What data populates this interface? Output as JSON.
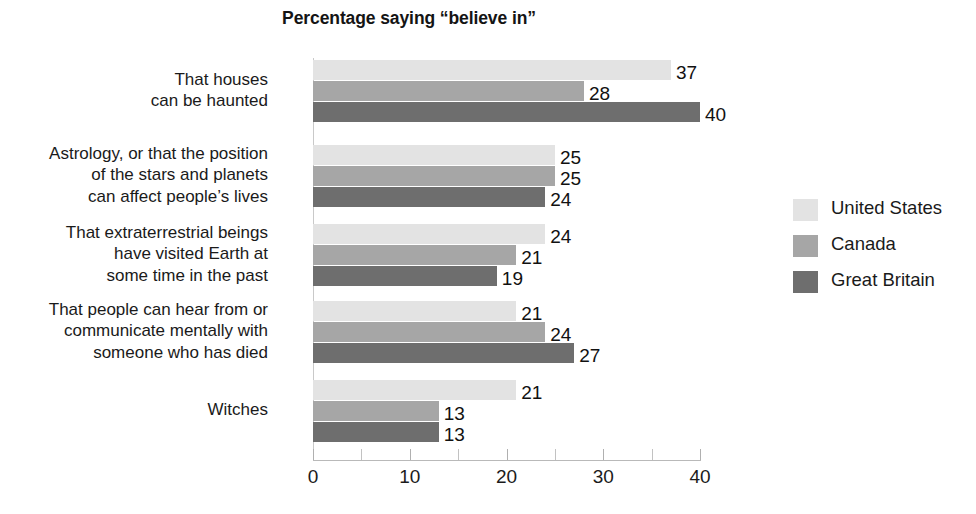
{
  "chart_data": {
    "type": "bar",
    "orientation": "horizontal",
    "title": "Percentage saying “believe in”",
    "xlabel": "",
    "ylabel": "",
    "xlim": [
      0,
      40
    ],
    "grid": false,
    "legend_position": "right",
    "xticks": [
      0,
      10,
      20,
      30,
      40
    ],
    "xtick_labels": [
      "0",
      "10",
      "20",
      "30",
      "40"
    ],
    "minor_tick_step": 5,
    "categories": [
      "That houses\ncan be haunted",
      "Astrology, or that the position\nof the stars and planets\ncan affect people’s lives",
      "That extraterrestrial beings\nhave visited Earth at\nsome time in the past",
      "That people can hear from or\ncommunicate mentally with\nsomeone who has died",
      "Witches"
    ],
    "series": [
      {
        "name": "United States",
        "color": "#e3e3e3",
        "values": [
          37,
          25,
          24,
          21,
          21
        ]
      },
      {
        "name": "Canada",
        "color": "#a6a6a6",
        "values": [
          28,
          25,
          21,
          24,
          13
        ]
      },
      {
        "name": "Great Britain",
        "color": "#6e6e6e",
        "values": [
          40,
          24,
          19,
          27,
          13
        ]
      }
    ],
    "value_labels": [
      [
        "37",
        "28",
        "40"
      ],
      [
        "25",
        "25",
        "24"
      ],
      [
        "24",
        "21",
        "19"
      ],
      [
        "21",
        "24",
        "27"
      ],
      [
        "21",
        "13",
        "13"
      ]
    ]
  },
  "legend": {
    "items": [
      {
        "label": "United States",
        "color": "#e3e3e3"
      },
      {
        "label": "Canada",
        "color": "#a6a6a6"
      },
      {
        "label": "Great Britain",
        "color": "#6e6e6e"
      }
    ]
  },
  "bottom_caption": {
    "text": ""
  }
}
